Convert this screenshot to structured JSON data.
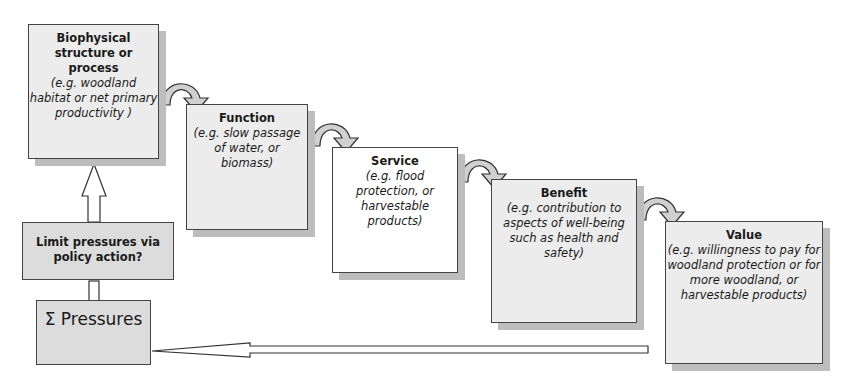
{
  "boxes": {
    "biophysical": {
      "title": "Biophysical structure or process",
      "desc": "(e.g. woodland habitat or net primary productivity )"
    },
    "function": {
      "title": "Function",
      "desc": "(e.g. slow passage of water, or biomass)"
    },
    "service": {
      "title": "Service",
      "desc": "(e.g. flood protection, or harvestable products)"
    },
    "benefit": {
      "title": "Benefit",
      "desc": "(e.g. contribution to aspects of well-being such as health and safety)"
    },
    "value": {
      "title": "Value",
      "desc": "(e.g. willingness to pay for woodland protection or for more woodland, or harvestable products)"
    },
    "policy": {
      "title": "Limit pressures via policy action?"
    },
    "pressures": {
      "title": "Σ Pressures"
    }
  },
  "colors": {
    "box_gray": "#dcdcdc",
    "box_light": "#ececec",
    "border": "#444444",
    "shadow": "#bdbdbd"
  }
}
